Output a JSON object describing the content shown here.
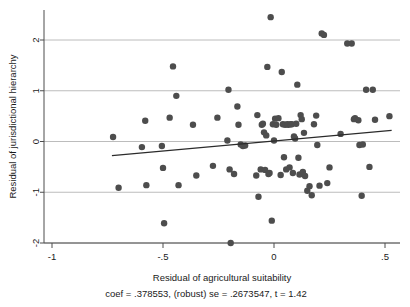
{
  "chart_data": {
    "type": "scatter",
    "title": "",
    "xlabel": "Residual of agricultural suitability",
    "ylabel": "Residual of jurisdictional hierarchy",
    "caption": "coef = .378553, (robust) se = .2673547, t = 1.42",
    "xlim": [
      -1.08,
      0.58
    ],
    "ylim": [
      -2.08,
      2.6
    ],
    "xticks": [
      -1,
      -0.5,
      0,
      0.5
    ],
    "xtick_labels": [
      "-1",
      "-.5",
      "0",
      ".5"
    ],
    "yticks": [
      -2,
      -1,
      0,
      1,
      2
    ],
    "ytick_labels": [
      "-2",
      "-1",
      "0",
      "1",
      "2"
    ],
    "grid": "horizontal",
    "grid_color": "#b4b4b4",
    "legend": "none",
    "marker_color": "#4d4d4d",
    "marker_size": 4.2,
    "fit_line": {
      "name": "linear fit",
      "color": "#2b2b2b",
      "coef": 0.378553,
      "se": 0.2673547,
      "t": 1.42,
      "x_start": -0.73,
      "y_start": -0.28,
      "x_end": 0.53,
      "y_end": 0.22
    },
    "points": [
      [
        -0.725,
        0.09
      ],
      [
        -0.7,
        -0.91
      ],
      [
        -0.595,
        -0.11
      ],
      [
        -0.58,
        0.41
      ],
      [
        -0.575,
        -0.86
      ],
      [
        -0.505,
        -0.09
      ],
      [
        -0.5,
        -0.52
      ],
      [
        -0.495,
        -1.61
      ],
      [
        -0.47,
        0.47
      ],
      [
        -0.455,
        1.48
      ],
      [
        -0.44,
        0.9
      ],
      [
        -0.43,
        -0.86
      ],
      [
        -0.365,
        0.33
      ],
      [
        -0.35,
        -0.67
      ],
      [
        -0.275,
        -0.48
      ],
      [
        -0.255,
        0.47
      ],
      [
        -0.21,
        0.02
      ],
      [
        -0.205,
        1.02
      ],
      [
        -0.2,
        -0.55
      ],
      [
        -0.195,
        -2.0
      ],
      [
        -0.18,
        -0.64
      ],
      [
        -0.165,
        0.69
      ],
      [
        -0.16,
        0.33
      ],
      [
        -0.15,
        -0.06
      ],
      [
        -0.14,
        -0.09
      ],
      [
        -0.13,
        -0.08
      ],
      [
        -0.08,
        -0.67
      ],
      [
        -0.075,
        0.52
      ],
      [
        -0.07,
        -1.09
      ],
      [
        -0.06,
        -0.55
      ],
      [
        -0.055,
        0.33
      ],
      [
        -0.05,
        0.35
      ],
      [
        -0.045,
        0.18
      ],
      [
        -0.04,
        -0.56
      ],
      [
        -0.035,
        0.12
      ],
      [
        -0.03,
        1.47
      ],
      [
        -0.025,
        -0.64
      ],
      [
        -0.02,
        -0.62
      ],
      [
        -0.015,
        2.45
      ],
      [
        -0.01,
        -1.56
      ],
      [
        -0.005,
        0.34
      ],
      [
        0.0,
        0.02
      ],
      [
        0.005,
        0.45
      ],
      [
        0.01,
        0.33
      ],
      [
        0.02,
        0.46
      ],
      [
        0.03,
        -0.66
      ],
      [
        0.035,
        1.37
      ],
      [
        0.04,
        0.34
      ],
      [
        0.045,
        -0.31
      ],
      [
        0.05,
        0.33
      ],
      [
        0.055,
        -0.55
      ],
      [
        0.06,
        0.34
      ],
      [
        0.065,
        0.33
      ],
      [
        0.07,
        -0.51
      ],
      [
        0.075,
        0.34
      ],
      [
        0.08,
        0.34
      ],
      [
        0.085,
        -0.62
      ],
      [
        0.09,
        0.1
      ],
      [
        0.095,
        0.06
      ],
      [
        0.1,
        0.35
      ],
      [
        0.105,
        1.12
      ],
      [
        0.11,
        -0.32
      ],
      [
        0.115,
        -0.65
      ],
      [
        0.12,
        0.52
      ],
      [
        0.125,
        0.44
      ],
      [
        0.13,
        -0.6
      ],
      [
        0.135,
        0.17
      ],
      [
        0.14,
        -0.68
      ],
      [
        0.15,
        -0.97
      ],
      [
        0.16,
        -0.88
      ],
      [
        0.17,
        -1.06
      ],
      [
        0.18,
        0.34
      ],
      [
        0.19,
        0.51
      ],
      [
        0.195,
        -0.07
      ],
      [
        0.205,
        -0.87
      ],
      [
        0.215,
        2.13
      ],
      [
        0.225,
        2.1
      ],
      [
        0.24,
        -0.82
      ],
      [
        0.25,
        -0.51
      ],
      [
        0.3,
        0.15
      ],
      [
        0.33,
        1.93
      ],
      [
        0.35,
        1.93
      ],
      [
        0.36,
        0.44
      ],
      [
        0.365,
        0.46
      ],
      [
        0.38,
        0.42
      ],
      [
        0.385,
        -0.07
      ],
      [
        0.395,
        -1.07
      ],
      [
        0.4,
        -0.06
      ],
      [
        0.415,
        1.02
      ],
      [
        0.43,
        -0.5
      ],
      [
        0.445,
        1.02
      ],
      [
        0.455,
        0.43
      ],
      [
        0.52,
        0.5
      ]
    ]
  }
}
